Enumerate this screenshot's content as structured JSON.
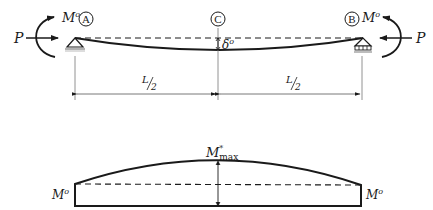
{
  "diagram": {
    "colors": {
      "line": "#1a1a1a",
      "thin": "#555555",
      "hatch": "#888888"
    },
    "beam": {
      "support_left_label": "A",
      "support_right_label": "B",
      "midspan_label": "C",
      "moment_left": "M",
      "moment_left_sup": "o",
      "moment_right": "M",
      "moment_right_sup": "o",
      "axial_left": "P",
      "axial_right": "P",
      "deflection_symbol": "δ",
      "deflection_sup": "o"
    },
    "dimensions": {
      "left_half_num": "L",
      "left_half_den": "2",
      "right_half_num": "L",
      "right_half_den": "2"
    },
    "moment_diagram": {
      "peak_label": "M",
      "peak_sup": "*",
      "peak_sub": "max",
      "end_left": "M",
      "end_left_sup": "o",
      "end_right": "M",
      "end_right_sup": "o"
    }
  }
}
